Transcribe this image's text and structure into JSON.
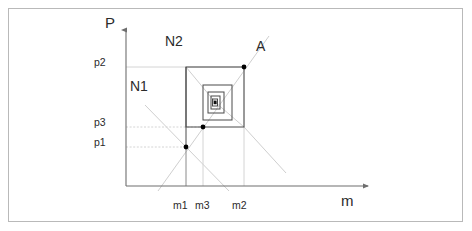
{
  "figure": {
    "type": "phase-diagram",
    "background_color": "#ffffff",
    "frame_color": "#b9b9b9",
    "axis_color": "#7a7a7a",
    "construction_color": "#cccccc",
    "gridline_color": "#d6d6d6",
    "spiral_color": "#555555",
    "point_color": "#000000"
  },
  "axes": {
    "x": {
      "label": "m",
      "label_x": 343,
      "label_y": 196,
      "origin_x": 126,
      "origin_y": 186,
      "end_x": 372,
      "arrow": "right",
      "tick_labels": [
        {
          "text": "m1",
          "x": 174,
          "y": 200
        },
        {
          "text": "m3",
          "x": 196,
          "y": 200
        },
        {
          "text": "m2",
          "x": 233,
          "y": 200
        }
      ],
      "tick_values": [
        {
          "name": "m1",
          "px": 186
        },
        {
          "name": "m3",
          "px": 203
        },
        {
          "name": "m2",
          "px": 244
        }
      ]
    },
    "y": {
      "label": "P",
      "label_x": 107,
      "label_y": 16,
      "origin_x": 126,
      "origin_y": 186,
      "end_y": 28,
      "arrow": "up",
      "tick_labels": [
        {
          "text": "p2",
          "x": 95,
          "y": 60
        },
        {
          "text": "p3",
          "x": 95,
          "y": 120
        },
        {
          "text": "p1",
          "x": 95,
          "y": 140
        }
      ],
      "tick_values": [
        {
          "name": "p2",
          "px": 67
        },
        {
          "name": "p3",
          "px": 127
        },
        {
          "name": "p1",
          "px": 147
        }
      ]
    }
  },
  "region_labels": [
    {
      "text": "N2",
      "x": 166,
      "y": 34
    },
    {
      "text": "N1",
      "x": 131,
      "y": 79
    }
  ],
  "point_labels": [
    {
      "text": "A",
      "x": 258,
      "y": 40
    }
  ],
  "marked_points": [
    {
      "name": "A",
      "x": 244,
      "y": 67
    },
    {
      "name": "p3-point",
      "x": 203,
      "y": 127
    },
    {
      "name": "p1-point",
      "x": 186,
      "y": 147
    },
    {
      "name": "center-point",
      "x": 215,
      "y": 102
    }
  ],
  "spiral": {
    "description": "nested rectangles converging to fixed point",
    "rects": [
      {
        "x1": 186,
        "y1": 67,
        "x2": 244,
        "y2": 127
      },
      {
        "x1": 203,
        "y1": 85,
        "x2": 232,
        "y2": 120
      },
      {
        "x1": 208,
        "y1": 92,
        "x2": 224,
        "y2": 113
      },
      {
        "x1": 211,
        "y1": 96,
        "x2": 220,
        "y2": 109
      },
      {
        "x1": 212.5,
        "y1": 99,
        "x2": 217.5,
        "y2": 106
      }
    ],
    "core": {
      "x1": 213.5,
      "y1": 100.5,
      "x2": 216.5,
      "y2": 104
    }
  },
  "gridlines": [
    {
      "name": "p2-gridline",
      "x1": 126,
      "y1": 67,
      "x2": 244,
      "y2": 67
    },
    {
      "name": "p3-gridline",
      "x1": 126,
      "y1": 127,
      "x2": 203,
      "y2": 127
    },
    {
      "name": "p1-gridline",
      "x1": 126,
      "y1": 147,
      "x2": 186,
      "y2": 147
    },
    {
      "name": "m1-gridline",
      "x1": 186,
      "y1": 147,
      "x2": 186,
      "y2": 186
    },
    {
      "name": "m3-gridline",
      "x1": 203,
      "y1": 127,
      "x2": 203,
      "y2": 186
    },
    {
      "name": "m2-gridline",
      "x1": 244,
      "y1": 67,
      "x2": 244,
      "y2": 186
    }
  ],
  "construction_lines": [
    {
      "name": "N1-line",
      "x1": 145,
      "y1": 105,
      "x2": 228,
      "y2": 190
    },
    {
      "name": "N2-line",
      "x1": 158,
      "y1": 190,
      "x2": 268,
      "y2": 37
    },
    {
      "name": "diagonal-tl",
      "x1": 186,
      "y1": 67,
      "x2": 215,
      "y2": 102
    },
    {
      "name": "diagonal-br",
      "x1": 244,
      "y1": 127,
      "x2": 215,
      "y2": 102
    },
    {
      "name": "diagonal-out-br",
      "x1": 244,
      "y1": 127,
      "x2": 285,
      "y2": 172
    }
  ]
}
